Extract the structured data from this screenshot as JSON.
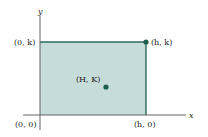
{
  "diagram": {
    "axes": {
      "x_label": "x",
      "y_label": "y"
    },
    "rectangle": {
      "fill": "#c6dcd8",
      "edge_color": "#2f6b5f",
      "corners": {
        "origin": "(0, 0)",
        "top_left": "(0, k)",
        "top_right": "(h, k)",
        "bottom_right": "(h, 0)"
      }
    },
    "points": [
      {
        "label": "(h, k)",
        "color": "#1f5e4e"
      },
      {
        "label": "(H, K)",
        "color": "#1f5e4e"
      }
    ]
  }
}
